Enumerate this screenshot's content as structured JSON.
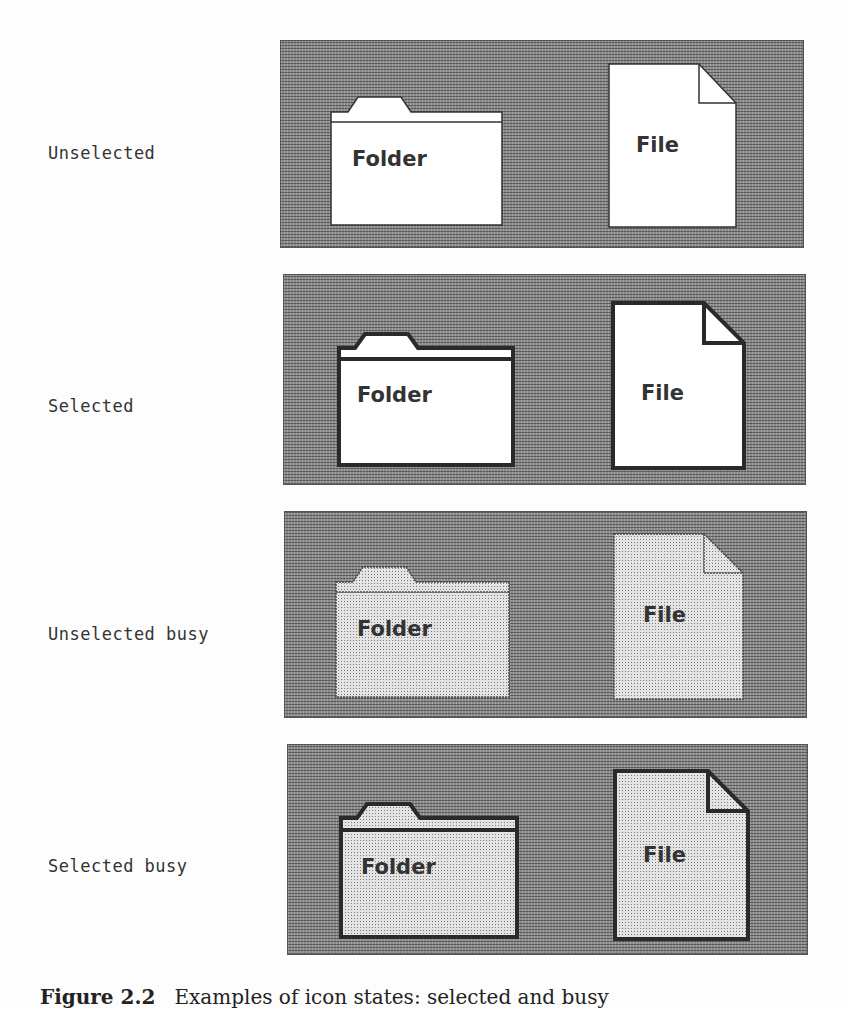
{
  "figure": {
    "rows": [
      {
        "label": "Unselected",
        "state": "unselected",
        "folder_label": "Folder",
        "file_label": "File"
      },
      {
        "label": "Selected",
        "state": "selected",
        "folder_label": "Folder",
        "file_label": "File"
      },
      {
        "label": "Unselected busy",
        "state": "unselected-busy",
        "folder_label": "Folder",
        "file_label": "File"
      },
      {
        "label": "Selected busy",
        "state": "selected-busy",
        "folder_label": "Folder",
        "file_label": "File"
      }
    ],
    "caption_prefix": "Figure 2.2",
    "caption_text": "Examples of icon states: selected and busy"
  },
  "colors": {
    "panel_pattern": "#8a8a8a",
    "icon_fill": "#ffffff",
    "busy_fill": "#d8d8d8",
    "outline": "#2a2a2a",
    "text": "#333333"
  }
}
